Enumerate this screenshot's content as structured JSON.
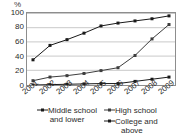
{
  "chart_data": {
    "type": "line",
    "title": "",
    "xlabel": "",
    "ylabel": "%",
    "ylim": [
      0,
      100
    ],
    "yticks": [
      0,
      20,
      40,
      60,
      80,
      100
    ],
    "grid": true,
    "legend_position": "bottom",
    "categories": [
      "2001",
      "2002",
      "2003",
      "2004",
      "2005",
      "2006",
      "2007",
      "2008",
      "2009"
    ],
    "series": [
      {
        "name": "Middle school and lower",
        "marker": "square",
        "color": "#1a1a1a",
        "values": [
          35,
          55,
          63,
          72,
          82,
          86,
          89,
          92,
          96
        ]
      },
      {
        "name": "High school",
        "marker": "square",
        "color": "#3d3d3d",
        "values": [
          6,
          11,
          13,
          16,
          20,
          24,
          41,
          64,
          84
        ]
      },
      {
        "name": "College and above",
        "marker": "square",
        "color": "#1a1a1a",
        "values": [
          0,
          0.5,
          1,
          1.5,
          2,
          2,
          5,
          8,
          11
        ]
      }
    ]
  },
  "axis": {
    "y_unit_label": "%",
    "y_tick_labels": [
      "100",
      "80",
      "60",
      "40",
      "20",
      "0"
    ],
    "x_tick_labels": [
      "2001",
      "2002",
      "2003",
      "2004",
      "2005",
      "2006",
      "2007",
      "2008",
      "2009"
    ]
  },
  "legend": {
    "items": [
      {
        "line1": "Middle school",
        "line2": "and lower"
      },
      {
        "line1": "High school",
        "line2": ""
      },
      {
        "line1": "College and",
        "line2": "above"
      }
    ]
  },
  "colors": {
    "axis": "#8d8d8d",
    "grid": "#c9c9c9",
    "series1": "#1a1a1a",
    "series2": "#3d3d3d",
    "series3": "#1a1a1a",
    "text": "#2b2b2b"
  }
}
